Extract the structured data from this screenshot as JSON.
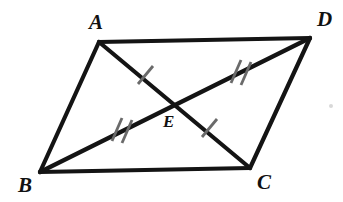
{
  "figure": {
    "type": "geometry-diagram",
    "canvas": {
      "width": 343,
      "height": 202,
      "background": "#ffffff"
    },
    "colors": {
      "stroke": "#141414",
      "tick": "#6a6a6a",
      "label": "#111111",
      "background": "#ffffff"
    },
    "stroke_width": 4.2,
    "tick_stroke_width": 2.6
  },
  "labels": {
    "A": "A",
    "B": "B",
    "C": "C",
    "D": "D",
    "E": "E"
  },
  "points": {
    "A": {
      "x": 99,
      "y": 42
    },
    "B": {
      "x": 40,
      "y": 172
    },
    "C": {
      "x": 250,
      "y": 168
    },
    "D": {
      "x": 310,
      "y": 38
    },
    "E": {
      "x": 175,
      "y": 103
    }
  },
  "segments": [
    {
      "name": "side-AD",
      "from": "A",
      "to": "D",
      "kind": "side"
    },
    {
      "name": "side-AB",
      "from": "A",
      "to": "B",
      "kind": "side"
    },
    {
      "name": "side-BC",
      "from": "B",
      "to": "C",
      "kind": "side"
    },
    {
      "name": "side-DC",
      "from": "D",
      "to": "C",
      "kind": "side"
    },
    {
      "name": "diagonal-AC",
      "from": "A",
      "to": "C",
      "kind": "diagonal"
    },
    {
      "name": "diagonal-BD",
      "from": "B",
      "to": "D",
      "kind": "diagonal"
    }
  ],
  "tick_marks": [
    {
      "name": "tick-AE",
      "segment": "A-E",
      "count": 1,
      "x": 145,
      "y": 75
    },
    {
      "name": "tick-EC",
      "segment": "E-C",
      "count": 1,
      "x": 209,
      "y": 128
    },
    {
      "name": "tick-ED",
      "segment": "E-D",
      "count": 2,
      "x": 240,
      "y": 72
    },
    {
      "name": "tick-BE",
      "segment": "B-E",
      "count": 2,
      "x": 121,
      "y": 130
    }
  ],
  "congruence": {
    "single_tick_pair": "AE = EC",
    "double_tick_pair": "BE = ED"
  }
}
